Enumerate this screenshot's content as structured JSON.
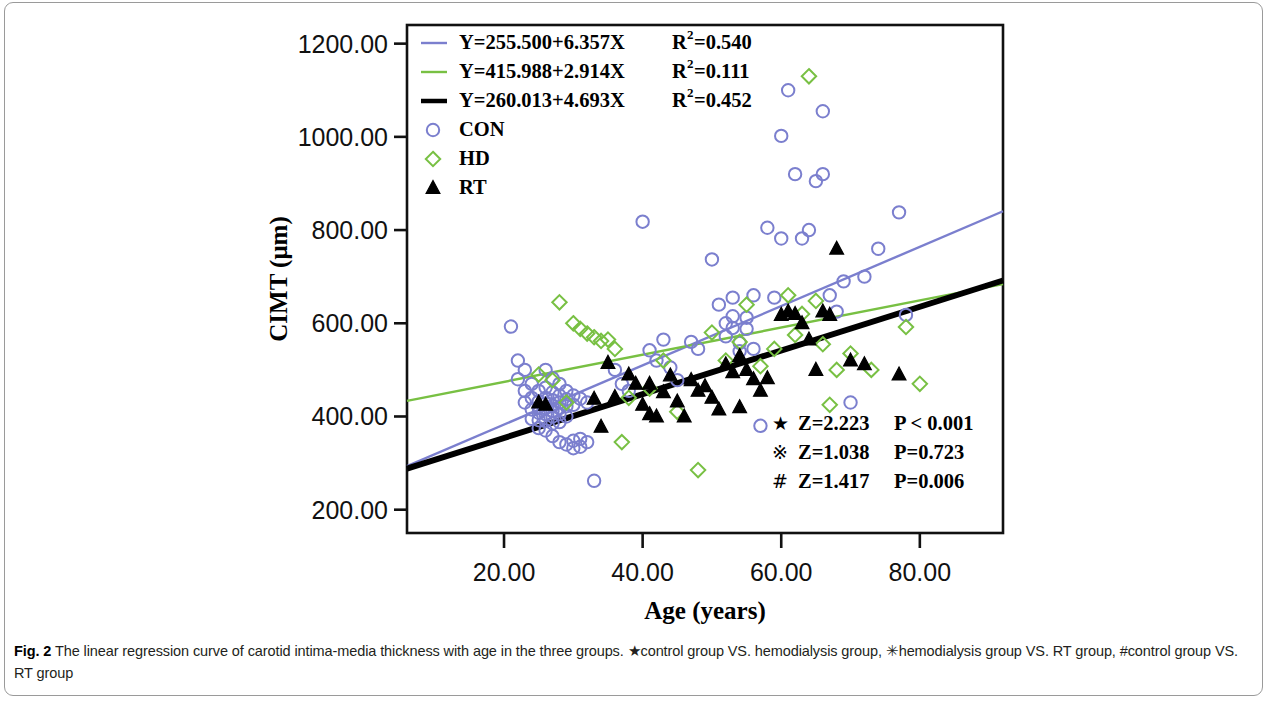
{
  "figure": {
    "caption_label": "Fig. 2",
    "caption_text": " The linear regression curve of carotid intima-media thickness with age in the three groups. ★control group VS. hemodialysis group, ✳hemodialysis group VS. RT group, #control group VS. RT group"
  },
  "colors": {
    "con": "#7b7fce",
    "hd": "#78c043",
    "rt": "#000000",
    "axis": "#111111",
    "frame": "#9a9a9a"
  },
  "chart_data": {
    "type": "scatter",
    "title": "",
    "xlabel": "Age (years)",
    "ylabel": "CIMT (μm)",
    "xlim": [
      6,
      92
    ],
    "ylim": [
      150,
      1240
    ],
    "xticks": [
      "20.00",
      "40.00",
      "60.00",
      "80.00"
    ],
    "xtick_values": [
      20,
      40,
      60,
      80
    ],
    "yticks": [
      "200.00",
      "400.00",
      "600.00",
      "800.00",
      "1000.00",
      "1200.00"
    ],
    "ytick_values": [
      200,
      400,
      600,
      800,
      1000,
      1200
    ],
    "grid": false,
    "legend_position": "top-left",
    "series": [
      {
        "name": "CON",
        "marker": "circle",
        "color": "#7b7fce",
        "equation": "Y=255.500+6.357X",
        "r2_label": "R",
        "r2_sup": "2",
        "r2_value": "=0.540",
        "slope": 6.357,
        "intercept": 255.5,
        "r2": 0.54,
        "points": [
          [
            21,
            593
          ],
          [
            22,
            520
          ],
          [
            22,
            480
          ],
          [
            23,
            500
          ],
          [
            23,
            455
          ],
          [
            23,
            430
          ],
          [
            24,
            470
          ],
          [
            24,
            440
          ],
          [
            24,
            415
          ],
          [
            24,
            395
          ],
          [
            25,
            455
          ],
          [
            25,
            432
          ],
          [
            25,
            420
          ],
          [
            25,
            408
          ],
          [
            25,
            392
          ],
          [
            25,
            375
          ],
          [
            26,
            500
          ],
          [
            26,
            462
          ],
          [
            26,
            440
          ],
          [
            26,
            428
          ],
          [
            26,
            418
          ],
          [
            26,
            405
          ],
          [
            26,
            390
          ],
          [
            26,
            370
          ],
          [
            27,
            482
          ],
          [
            27,
            452
          ],
          [
            27,
            435
          ],
          [
            27,
            423
          ],
          [
            27,
            412
          ],
          [
            27,
            400
          ],
          [
            27,
            385
          ],
          [
            27,
            358
          ],
          [
            28,
            470
          ],
          [
            28,
            445
          ],
          [
            28,
            430
          ],
          [
            28,
            418
          ],
          [
            28,
            405
          ],
          [
            28,
            388
          ],
          [
            28,
            345
          ],
          [
            29,
            455
          ],
          [
            29,
            437
          ],
          [
            29,
            422
          ],
          [
            29,
            400
          ],
          [
            29,
            340
          ],
          [
            30,
            445
          ],
          [
            30,
            425
          ],
          [
            30,
            348
          ],
          [
            30,
            332
          ],
          [
            31,
            438
          ],
          [
            31,
            352
          ],
          [
            31,
            335
          ],
          [
            32,
            430
          ],
          [
            32,
            345
          ],
          [
            33,
            262
          ],
          [
            36,
            500
          ],
          [
            37,
            470
          ],
          [
            38,
            455
          ],
          [
            40,
            818
          ],
          [
            41,
            542
          ],
          [
            42,
            520
          ],
          [
            43,
            565
          ],
          [
            44,
            505
          ],
          [
            45,
            478
          ],
          [
            47,
            560
          ],
          [
            48,
            545
          ],
          [
            50,
            737
          ],
          [
            51,
            640
          ],
          [
            52,
            600
          ],
          [
            52,
            572
          ],
          [
            53,
            655
          ],
          [
            53,
            615
          ],
          [
            53,
            590
          ],
          [
            54,
            558
          ],
          [
            54,
            540
          ],
          [
            55,
            612
          ],
          [
            55,
            588
          ],
          [
            56,
            660
          ],
          [
            56,
            545
          ],
          [
            57,
            380
          ],
          [
            58,
            805
          ],
          [
            59,
            655
          ],
          [
            60,
            1002
          ],
          [
            60,
            782
          ],
          [
            61,
            1100
          ],
          [
            62,
            920
          ],
          [
            63,
            782
          ],
          [
            64,
            800
          ],
          [
            65,
            905
          ],
          [
            66,
            1055
          ],
          [
            66,
            920
          ],
          [
            67,
            660
          ],
          [
            68,
            625
          ],
          [
            69,
            690
          ],
          [
            70,
            430
          ],
          [
            72,
            700
          ],
          [
            74,
            760
          ],
          [
            77,
            838
          ],
          [
            78,
            618
          ]
        ]
      },
      {
        "name": "HD",
        "marker": "diamond",
        "color": "#78c043",
        "equation": "Y=415.988+2.914X",
        "r2_label": "R",
        "r2_sup": "2",
        "r2_value": "=0.111",
        "slope": 2.914,
        "intercept": 415.988,
        "r2": 0.111,
        "points": [
          [
            25,
            490
          ],
          [
            27,
            478
          ],
          [
            28,
            645
          ],
          [
            29,
            430
          ],
          [
            30,
            600
          ],
          [
            31,
            588
          ],
          [
            32,
            578
          ],
          [
            33,
            570
          ],
          [
            34,
            562
          ],
          [
            35,
            565
          ],
          [
            36,
            545
          ],
          [
            37,
            345
          ],
          [
            38,
            440
          ],
          [
            41,
            460
          ],
          [
            43,
            520
          ],
          [
            45,
            410
          ],
          [
            48,
            285
          ],
          [
            50,
            580
          ],
          [
            52,
            520
          ],
          [
            54,
            560
          ],
          [
            55,
            640
          ],
          [
            57,
            508
          ],
          [
            59,
            545
          ],
          [
            61,
            660
          ],
          [
            62,
            575
          ],
          [
            63,
            620
          ],
          [
            64,
            1130
          ],
          [
            65,
            648
          ],
          [
            66,
            555
          ],
          [
            67,
            425
          ],
          [
            68,
            500
          ],
          [
            70,
            535
          ],
          [
            73,
            500
          ],
          [
            78,
            592
          ],
          [
            80,
            470
          ]
        ]
      },
      {
        "name": "RT",
        "marker": "triangle",
        "color": "#000000",
        "equation": "Y=260.013+4.693X",
        "r2_label": "R",
        "r2_sup": "2",
        "r2_value": "=0.452",
        "slope": 4.693,
        "intercept": 260.013,
        "r2": 0.452,
        "points": [
          [
            25,
            430
          ],
          [
            26,
            425
          ],
          [
            33,
            438
          ],
          [
            34,
            378
          ],
          [
            35,
            515
          ],
          [
            36,
            442
          ],
          [
            38,
            490
          ],
          [
            39,
            470
          ],
          [
            40,
            425
          ],
          [
            41,
            405
          ],
          [
            41,
            470
          ],
          [
            42,
            400
          ],
          [
            43,
            452
          ],
          [
            44,
            488
          ],
          [
            45,
            432
          ],
          [
            46,
            400
          ],
          [
            47,
            478
          ],
          [
            48,
            455
          ],
          [
            49,
            465
          ],
          [
            50,
            440
          ],
          [
            51,
            415
          ],
          [
            52,
            512
          ],
          [
            53,
            495
          ],
          [
            54,
            530
          ],
          [
            54,
            420
          ],
          [
            55,
            500
          ],
          [
            56,
            480
          ],
          [
            57,
            455
          ],
          [
            58,
            482
          ],
          [
            60,
            618
          ],
          [
            61,
            625
          ],
          [
            62,
            620
          ],
          [
            63,
            600
          ],
          [
            64,
            565
          ],
          [
            65,
            500
          ],
          [
            66,
            625
          ],
          [
            67,
            618
          ],
          [
            68,
            760
          ],
          [
            70,
            520
          ],
          [
            72,
            512
          ],
          [
            77,
            490
          ]
        ]
      }
    ],
    "annotations": [
      {
        "symbol": "★",
        "z": "Z=2.223",
        "p": "P < 0.001"
      },
      {
        "symbol": "※",
        "z": "Z=1.038",
        "p": "P=0.723"
      },
      {
        "symbol": "#",
        "z": "Z=1.417",
        "p": "P=0.006"
      }
    ]
  }
}
